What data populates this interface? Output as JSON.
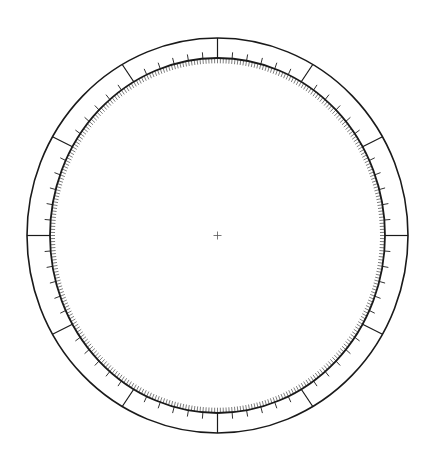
{
  "dial": {
    "title": "",
    "center": {
      "x": 217.5,
      "y": 235.5
    },
    "outer_ring": {
      "rx": 190.5,
      "ry": 197.5,
      "stroke_width": 1.6
    },
    "inner_ring": {
      "rx": 167.5,
      "ry": 177.5,
      "stroke_width": 1.8
    },
    "major_ticks": {
      "step_deg": 30,
      "count": 12,
      "stroke_width": 1.2,
      "span": "inner-to-outer"
    },
    "intermediate_ticks": {
      "step_deg": 5,
      "length": 6,
      "direction": "outward",
      "stroke_width": 0.9
    },
    "minor_ticks": {
      "step_deg": 1,
      "length": 5,
      "direction": "inward",
      "stroke_width": 0.7
    },
    "center_mark": {
      "type": "crosshair",
      "size": 8,
      "stroke_width": 0.8
    },
    "colors": {
      "stroke": "#1a1a1a",
      "background": "#ffffff",
      "minor_stroke": "#444444",
      "center_stroke": "#555555"
    }
  }
}
